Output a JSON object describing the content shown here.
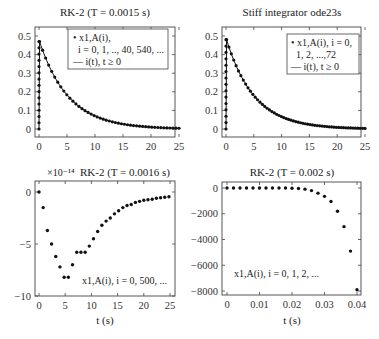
{
  "chart_data": [
    {
      "id": "tl",
      "type": "scatter",
      "title": "RK-2 (T = 0.0015 s)",
      "xlabel": "",
      "ylabel": "",
      "xlim": [
        0,
        25
      ],
      "ylim": [
        0,
        0.5
      ],
      "xticks": [
        0,
        5,
        10,
        15,
        20,
        25
      ],
      "yticks": [
        0,
        0.1,
        0.2,
        0.3,
        0.4,
        0.5
      ],
      "ytick_labels": [
        "0",
        "0.1",
        "0.2",
        "0.3",
        "0.4",
        "0.5"
      ],
      "legend": [
        "x_{1,A}(i), i = 0, 1, .., 40, 540, ...",
        "i(t), t ≥ 0"
      ],
      "legend_lines": [
        "• x1,A(i),",
        "  i = 0, 1, .., 40, 540, ...",
        "— i(t), t ≥ 0"
      ],
      "series": [
        {
          "name": "x_{1,A}(i)",
          "style": "markers",
          "curve": "rise_decay",
          "peak_t": 0.1,
          "peak": 0.47,
          "tau": 5.2,
          "t_max": 25,
          "n_decay": 46,
          "n_rise": 14
        },
        {
          "name": "i(t)",
          "style": "line"
        }
      ]
    },
    {
      "id": "tr",
      "type": "scatter",
      "title": "Stiff integrator ode23s",
      "xlabel": "",
      "ylabel": "",
      "xlim": [
        0,
        25
      ],
      "ylim": [
        0,
        0.5
      ],
      "xticks": [
        0,
        5,
        10,
        15,
        20,
        25
      ],
      "yticks": [
        0,
        0.1,
        0.2,
        0.3,
        0.4,
        0.5
      ],
      "ytick_labels": [
        "0",
        "0.1",
        "0.2",
        "0.3",
        "0.4",
        "0.5"
      ],
      "legend": [
        "x_{1,A}(i), i = 0, 1, 2, ..., 72",
        "i(t), t ≥ 0"
      ],
      "legend_lines": [
        "• x1,A(i), i = 0,",
        "  1, 2, ...,72",
        "— i(t), t ≥ 0"
      ],
      "series": [
        {
          "name": "x_{1,A}(i)",
          "style": "markers",
          "curve": "rise_decay",
          "peak_t": 0.1,
          "peak": 0.48,
          "tau": 5.0,
          "t_max": 25,
          "n_decay": 58,
          "n_rise": 14
        },
        {
          "name": "i(t)",
          "style": "line"
        }
      ]
    },
    {
      "id": "bl",
      "type": "scatter",
      "title": "RK-2 (T = 0.0016 s)",
      "exponent_label": "×10⁻¹⁴",
      "xlabel": "t (s)",
      "ylabel": "",
      "xlim": [
        0,
        25
      ],
      "ylim": [
        -10,
        0
      ],
      "xticks": [
        0,
        5,
        10,
        15,
        20,
        25
      ],
      "yticks": [
        0,
        -5,
        -10
      ],
      "ytick_labels": [
        "0",
        "−5",
        "−10"
      ],
      "annotation": "x1,A(i), i = 0, 500, ...",
      "series": [
        {
          "name": "x_{1,A}(i)",
          "style": "markers",
          "x": [
            0,
            0.8,
            1.6,
            2.4,
            3.2,
            4.0,
            4.8,
            5.6,
            6.4,
            7.2,
            8.0,
            8.8,
            9.6,
            10.4,
            11.2,
            12.0,
            12.8,
            13.6,
            14.4,
            15.2,
            16.0,
            16.8,
            17.6,
            18.4,
            19.2,
            20.0,
            20.8,
            21.6,
            22.4,
            23.2,
            24.0,
            24.8
          ],
          "y": [
            0,
            -1.5,
            -3.7,
            -5.0,
            -6.2,
            -7.2,
            -8.2,
            -8.2,
            -7.0,
            -5.8,
            -5.8,
            -5.8,
            -5.2,
            -4.5,
            -3.8,
            -3.2,
            -2.8,
            -2.5,
            -2.1,
            -1.8,
            -1.5,
            -1.3,
            -1.2,
            -1.0,
            -0.9,
            -0.8,
            -0.75,
            -0.7,
            -0.6,
            -0.55,
            -0.5,
            -0.45
          ]
        }
      ]
    },
    {
      "id": "br",
      "type": "scatter",
      "title": "RK-2 (T = 0.002 s)",
      "xlabel": "t (s)",
      "ylabel": "",
      "xlim": [
        -0.001,
        0.041
      ],
      "ylim": [
        -8200,
        400
      ],
      "xticks": [
        0,
        0.01,
        0.02,
        0.03,
        0.04
      ],
      "xtick_labels": [
        "0",
        "0.01",
        "0.02",
        "0.03",
        "0.04"
      ],
      "yticks": [
        0,
        -2000,
        -4000,
        -6000,
        -8000
      ],
      "ytick_labels": [
        "0",
        "−2000",
        "−4000",
        "−6000",
        "−8000"
      ],
      "annotation": "x1,A(i), i = 0, 1, 2, ...",
      "series": [
        {
          "name": "x_{1,A}(i)",
          "style": "markers",
          "x": [
            0,
            0.002,
            0.004,
            0.006,
            0.008,
            0.01,
            0.012,
            0.014,
            0.016,
            0.018,
            0.02,
            0.022,
            0.024,
            0.026,
            0.028,
            0.03,
            0.032,
            0.034,
            0.036,
            0.038,
            0.04
          ],
          "y": [
            0,
            0,
            0,
            0,
            0,
            0,
            0,
            0,
            0,
            -5,
            -15,
            -40,
            -90,
            -200,
            -400,
            -650,
            -1050,
            -1800,
            -3000,
            -4900,
            -7900
          ]
        }
      ]
    }
  ],
  "layout": {
    "panels": {
      "tl": {
        "x0": 35,
        "x1": 175,
        "y0": 129,
        "y1": 36,
        "box": [
          35,
          27,
          175,
          137
        ],
        "title_y": 16
      },
      "tr": {
        "x0": 222,
        "x1": 361,
        "y0": 129,
        "y1": 36,
        "box": [
          222,
          27,
          361,
          137
        ],
        "title_y": 16
      },
      "bl": {
        "x0": 39,
        "x1": 170,
        "y0": 192,
        "y1": 296,
        "box": [
          35,
          181,
          175,
          296
        ],
        "title_y": 175
      },
      "br": {
        "x0": 227,
        "x1": 357,
        "y0": 188,
        "y1": 291,
        "box": [
          222,
          182,
          361,
          295
        ],
        "title_y": 175
      }
    }
  }
}
